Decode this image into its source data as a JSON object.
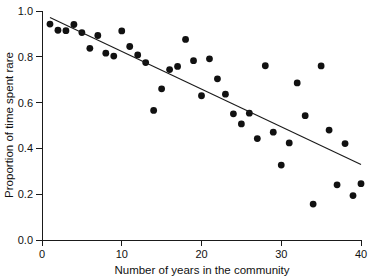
{
  "chart_data": {
    "type": "scatter",
    "title": "",
    "xlabel": "Number of years in the community",
    "ylabel": "Proportion of time spent rare",
    "xlim": [
      0,
      40
    ],
    "ylim": [
      0.0,
      1.0
    ],
    "xticks": [
      0,
      10,
      20,
      30,
      40
    ],
    "yticks": [
      0.0,
      0.2,
      0.4,
      0.6,
      0.8,
      1.0
    ],
    "xtick_labels": [
      "0",
      "10",
      "20",
      "30",
      "40"
    ],
    "ytick_labels": [
      "0.0",
      "0.2",
      "0.4",
      "0.6",
      "0.8",
      "1.0"
    ],
    "grid": false,
    "legend": false,
    "marker": "filled-circle",
    "marker_color": "#111111",
    "points": [
      {
        "x": 1,
        "y": 0.943
      },
      {
        "x": 2,
        "y": 0.916
      },
      {
        "x": 3,
        "y": 0.914
      },
      {
        "x": 4,
        "y": 0.941
      },
      {
        "x": 5,
        "y": 0.906
      },
      {
        "x": 6,
        "y": 0.837
      },
      {
        "x": 7,
        "y": 0.893
      },
      {
        "x": 8,
        "y": 0.816
      },
      {
        "x": 9,
        "y": 0.803
      },
      {
        "x": 10,
        "y": 0.913
      },
      {
        "x": 11,
        "y": 0.845
      },
      {
        "x": 12,
        "y": 0.808
      },
      {
        "x": 13,
        "y": 0.775
      },
      {
        "x": 14,
        "y": 0.566
      },
      {
        "x": 15,
        "y": 0.66
      },
      {
        "x": 16,
        "y": 0.744
      },
      {
        "x": 17,
        "y": 0.758
      },
      {
        "x": 18,
        "y": 0.876
      },
      {
        "x": 19,
        "y": 0.783
      },
      {
        "x": 20,
        "y": 0.63
      },
      {
        "x": 21,
        "y": 0.791
      },
      {
        "x": 22,
        "y": 0.704
      },
      {
        "x": 23,
        "y": 0.637
      },
      {
        "x": 24,
        "y": 0.551
      },
      {
        "x": 25,
        "y": 0.507
      },
      {
        "x": 26,
        "y": 0.554
      },
      {
        "x": 27,
        "y": 0.443
      },
      {
        "x": 28,
        "y": 0.761
      },
      {
        "x": 29,
        "y": 0.471
      },
      {
        "x": 30,
        "y": 0.327
      },
      {
        "x": 31,
        "y": 0.424
      },
      {
        "x": 32,
        "y": 0.686
      },
      {
        "x": 33,
        "y": 0.543
      },
      {
        "x": 34,
        "y": 0.157
      },
      {
        "x": 35,
        "y": 0.76
      },
      {
        "x": 36,
        "y": 0.48
      },
      {
        "x": 37,
        "y": 0.241
      },
      {
        "x": 38,
        "y": 0.421
      },
      {
        "x": 39,
        "y": 0.194
      },
      {
        "x": 40,
        "y": 0.246
      }
    ],
    "fit_line": {
      "type": "linear-regression",
      "x_start": 1.0,
      "y_start": 0.972,
      "x_end": 40.0,
      "y_end": 0.33
    }
  }
}
